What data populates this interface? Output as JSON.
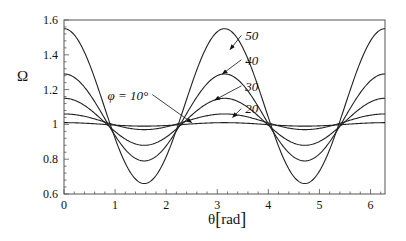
{
  "chart_data": {
    "type": "line",
    "title": "",
    "xlabel": "θ[rad]",
    "ylabel": "Ω",
    "xlim": [
      0,
      6.2832
    ],
    "ylim": [
      0.6,
      1.6
    ],
    "xticks": [
      0,
      1,
      2,
      3,
      4,
      5,
      6
    ],
    "yticks": [
      0.6,
      0.8,
      1,
      1.2,
      1.4,
      1.6
    ],
    "ytick_labels": [
      "0.6",
      "0.8",
      "1",
      "1.2",
      "1.4",
      "1.6"
    ],
    "grid": false,
    "legend": "inline annotations with arrows",
    "model": "Ω(θ) ≈ mid + amp·cos(2θ)",
    "series": [
      {
        "name": "φ = 10°",
        "label": "φ = 10°",
        "max": 1.01,
        "min": 0.99
      },
      {
        "name": "20",
        "label": "20",
        "max": 1.06,
        "min": 0.97
      },
      {
        "name": "30",
        "label": "30",
        "max": 1.15,
        "min": 0.88
      },
      {
        "name": "40",
        "label": "40",
        "max": 1.29,
        "min": 0.79
      },
      {
        "name": "50",
        "label": "50",
        "max": 1.55,
        "min": 0.66
      }
    ],
    "sample_points": {
      "x": [
        0,
        0.7854,
        1.5708,
        2.3562,
        3.1416,
        3.927,
        4.7124,
        5.4978,
        6.2832
      ],
      "φ=10": [
        1.01,
        1.0,
        0.99,
        1.0,
        1.01,
        1.0,
        0.99,
        1.0,
        1.01
      ],
      "φ=20": [
        1.06,
        1.015,
        0.97,
        1.015,
        1.06,
        1.015,
        0.97,
        1.015,
        1.06
      ],
      "φ=30": [
        1.15,
        1.015,
        0.88,
        1.015,
        1.15,
        1.015,
        0.88,
        1.015,
        1.15
      ],
      "φ=40": [
        1.29,
        1.04,
        0.79,
        1.04,
        1.29,
        1.04,
        0.79,
        1.04,
        1.29
      ],
      "φ=50": [
        1.55,
        1.105,
        0.66,
        1.105,
        1.55,
        1.105,
        0.66,
        1.105,
        1.55
      ]
    },
    "annotations": [
      {
        "text": "50",
        "x_text": 3.55,
        "y_text": 1.5,
        "x_arrow": 3.25,
        "y_arrow": 1.43
      },
      {
        "text": "40",
        "x_text": 3.55,
        "y_text": 1.36,
        "x_arrow": 3.1,
        "y_arrow": 1.29
      },
      {
        "text": "30",
        "x_text": 3.55,
        "y_text": 1.21,
        "x_arrow": 2.95,
        "y_arrow": 1.14
      },
      {
        "text": "20",
        "x_text": 3.55,
        "y_text": 1.08,
        "x_arrow": 3.3,
        "y_arrow": 1.04
      },
      {
        "text": "φ = 10°",
        "x_text": 1.65,
        "y_text": 1.16,
        "x_arrow": 2.5,
        "y_arrow": 1.01
      }
    ]
  },
  "labels": {
    "ylabel": "Ω",
    "xlabel_theta": "θ",
    "xlabel_unit": "rad"
  }
}
